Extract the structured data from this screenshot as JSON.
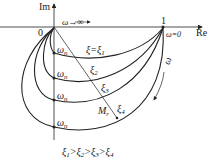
{
  "axes": {
    "im_label": "Im",
    "re_label": "Re",
    "origin_label": "0",
    "one_label": "1",
    "omega_inf": "ω→∞",
    "omega_zero": "ω=0"
  },
  "curves": [
    {
      "xi": "ξ=ξ",
      "sub": "1",
      "omega_n": "ω",
      "n": "n"
    },
    {
      "xi": "ξ",
      "sub": "2",
      "omega_n": "ω",
      "n": "n"
    },
    {
      "xi": "ξ",
      "sub": "3",
      "omega_n": "ω",
      "n": "n"
    },
    {
      "xi": "ξ",
      "sub": "4",
      "omega_n": "ω",
      "n": "n"
    }
  ],
  "mr_label": "M",
  "mr_sub": "r",
  "omega_arrow": "ω",
  "caption": {
    "parts": [
      "ξ",
      "1",
      ">ξ",
      "2",
      ">ξ",
      "3",
      ">ξ",
      "4"
    ]
  },
  "colors": {
    "stroke": "#222222",
    "background": "#ffffff"
  }
}
